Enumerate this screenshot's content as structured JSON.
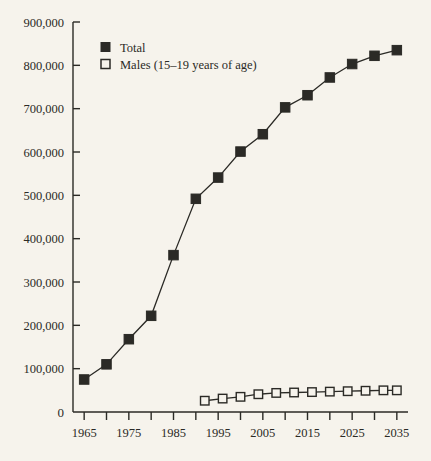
{
  "chart_data": {
    "type": "line",
    "title": "",
    "subtitle": "",
    "xlabel": "",
    "ylabel": "",
    "xlim": [
      1962.5,
      2037.5
    ],
    "ylim": [
      0,
      900000
    ],
    "grid": false,
    "legend_position": "top-left",
    "x_tick_values": [
      1965,
      1970,
      1975,
      1980,
      1985,
      1990,
      1995,
      2000,
      2005,
      2010,
      2015,
      2020,
      2025,
      2030,
      2035
    ],
    "x_tick_labels": [
      "1965",
      "",
      "1975",
      "",
      "1985",
      "",
      "1995",
      "",
      "2005",
      "",
      "2015",
      "",
      "2025",
      "",
      "2035"
    ],
    "y_tick_values": [
      0,
      100000,
      200000,
      300000,
      400000,
      500000,
      600000,
      700000,
      800000,
      900000
    ],
    "y_tick_labels": [
      "0",
      "100,000",
      "200,000",
      "300,000",
      "400,000",
      "500,000",
      "600,000",
      "700,000",
      "800,000",
      "900,000"
    ],
    "marker_colors": {
      "total": "#2b2a26",
      "males": "#f6f3ec"
    },
    "line_color": "#2b2a26",
    "series": [
      {
        "name": "Total",
        "marker": "filled-square",
        "x": [
          1965,
          1970,
          1975,
          1980,
          1985,
          1990,
          1993,
          1996,
          2000,
          2003,
          2007,
          2011,
          2015,
          2019,
          2022,
          2026,
          2030,
          2034
        ],
        "values": [
          75000,
          110000,
          168000,
          222000,
          362000,
          492000,
          541000,
          601000,
          641000,
          703000,
          731000,
          772000,
          803000,
          822000,
          835000,
          null,
          null,
          null
        ]
      },
      {
        "name": "Males (15–19 years of age)",
        "marker": "open-square",
        "x": [
          1992,
          1996,
          2000,
          2004,
          2008,
          2012,
          2016,
          2020,
          2024,
          2028,
          2032,
          2035
        ],
        "values": [
          26000,
          31000,
          35000,
          41000,
          44000,
          45000,
          46000,
          47000,
          48000,
          49000,
          50000,
          50000
        ]
      }
    ],
    "total_points": [
      {
        "x": 1965,
        "y": 75000
      },
      {
        "x": 1970,
        "y": 110000
      },
      {
        "x": 1975,
        "y": 168000
      },
      {
        "x": 1980,
        "y": 222000
      },
      {
        "x": 1985,
        "y": 362000
      },
      {
        "x": 1990,
        "y": 492000
      },
      {
        "x": 1995,
        "y": 541000
      },
      {
        "x": 2000,
        "y": 601000
      },
      {
        "x": 2005,
        "y": 641000
      },
      {
        "x": 2010,
        "y": 703000
      },
      {
        "x": 2015,
        "y": 731000
      },
      {
        "x": 2020,
        "y": 772000
      },
      {
        "x": 2025,
        "y": 803000
      },
      {
        "x": 2030,
        "y": 822000
      },
      {
        "x": 2035,
        "y": 835000
      }
    ],
    "males_points": [
      {
        "x": 1992,
        "y": 26000
      },
      {
        "x": 1996,
        "y": 31000
      },
      {
        "x": 2000,
        "y": 35000
      },
      {
        "x": 2004,
        "y": 41000
      },
      {
        "x": 2008,
        "y": 44000
      },
      {
        "x": 2012,
        "y": 45000
      },
      {
        "x": 2016,
        "y": 46000
      },
      {
        "x": 2020,
        "y": 47000
      },
      {
        "x": 2024,
        "y": 48000
      },
      {
        "x": 2028,
        "y": 49000
      },
      {
        "x": 2032,
        "y": 50000
      },
      {
        "x": 2035,
        "y": 50000
      }
    ],
    "legend": [
      {
        "label": "Total",
        "marker": "filled-square"
      },
      {
        "label": "Males (15–19 years of age)",
        "marker": "open-square"
      }
    ]
  },
  "axis": {
    "y_labels": [
      "900,000",
      "800,000",
      "700,000",
      "600,000",
      "500,000",
      "400,000",
      "300,000",
      "200,000",
      "100,000",
      "0"
    ],
    "x_labels": [
      "1965",
      "1975",
      "1985",
      "1995",
      "2005",
      "2015",
      "2025",
      "2035"
    ]
  },
  "legend": {
    "total_label": "Total",
    "males_label": "Males (15–19 years of age)"
  },
  "colors": {
    "background": "#f6f3ec",
    "ink": "#2b2a26",
    "marker_fill": "#2b2a26",
    "marker_open_fill": "#f6f3ec"
  }
}
